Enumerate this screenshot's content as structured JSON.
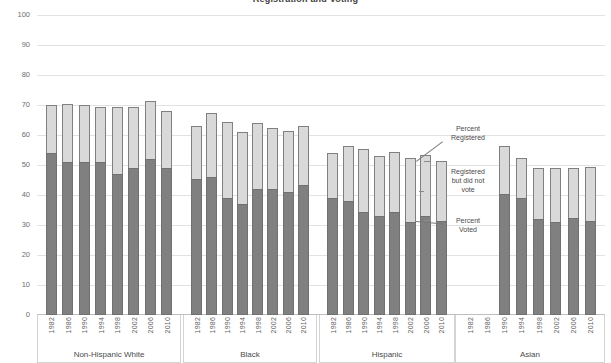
{
  "chart_data": {
    "type": "bar",
    "subtype": "stacked-bar-grouped",
    "title": "Registration and Voting",
    "xlabel": "",
    "ylabel": "",
    "ylim": [
      0,
      100
    ],
    "yticks": [
      0,
      10,
      20,
      30,
      40,
      50,
      60,
      70,
      80,
      90,
      100
    ],
    "grid": true,
    "legend_position": "annotations-inline",
    "series": [
      {
        "name": "Percent Voted",
        "color": "#808080"
      },
      {
        "name": "Registered but did not vote",
        "color": "#d9d9d9"
      }
    ],
    "annotations": [
      {
        "id": "percent-registered",
        "text": "Percent\nRegistered"
      },
      {
        "id": "registered-not-voted",
        "text": "Registered\nbut did not\nvote"
      },
      {
        "id": "percent-voted",
        "text": "Percent\nVoted"
      }
    ],
    "groups": [
      {
        "label": "Non-Hispanic White",
        "categories": [
          "1982",
          "1986",
          "1990",
          "1994",
          "1998",
          "2002",
          "2006",
          "2010"
        ],
        "registered": [
          70.0,
          70.5,
          70.0,
          69.5,
          69.5,
          69.5,
          71.5,
          68.0
        ],
        "voted": [
          54.0,
          51.0,
          51.0,
          51.0,
          47.0,
          49.0,
          52.0,
          49.0
        ]
      },
      {
        "label": "Black",
        "categories": [
          "1982",
          "1986",
          "1990",
          "1994",
          "1998",
          "2002",
          "2006",
          "2010"
        ],
        "registered": [
          63.0,
          67.5,
          64.5,
          61.0,
          64.0,
          62.5,
          61.5,
          63.0
        ],
        "voted": [
          45.5,
          46.0,
          39.0,
          37.0,
          42.0,
          42.0,
          41.0,
          43.5
        ]
      },
      {
        "label": "Hispanic",
        "categories": [
          "1982",
          "1986",
          "1990",
          "1994",
          "1998",
          "2002",
          "2006",
          "2010"
        ],
        "registered": [
          54.0,
          56.5,
          55.5,
          53.0,
          54.5,
          52.5,
          53.5,
          51.5
        ],
        "voted": [
          39.0,
          38.0,
          34.5,
          33.0,
          34.5,
          31.0,
          33.0,
          31.5
        ]
      },
      {
        "label": "Asian",
        "categories": [
          "1982",
          "1986",
          "1990",
          "1994",
          "1998",
          "2002",
          "2006",
          "2010"
        ],
        "registered": [
          null,
          null,
          56.5,
          52.5,
          49.0,
          49.0,
          49.0,
          49.5
        ],
        "voted": [
          null,
          null,
          40.5,
          39.0,
          32.0,
          31.0,
          32.5,
          31.5
        ]
      }
    ]
  },
  "colors": {
    "segment_voted": "#808080",
    "segment_registered_not_voted": "#d9d9d9",
    "bar_outline": "#808080",
    "gridline": "#e2e2e2",
    "tick_text": "#6e6e6e"
  }
}
